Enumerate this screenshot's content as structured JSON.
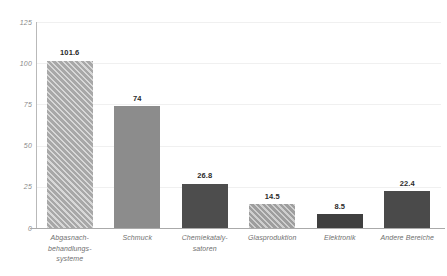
{
  "chart_data": {
    "type": "bar",
    "title": "",
    "subtitle": "",
    "xlabel": "",
    "ylabel": "",
    "ylim": [
      0,
      125
    ],
    "yticks": [
      "0",
      "25",
      "50",
      "75",
      "100",
      "125"
    ],
    "grid": true,
    "legend": false,
    "categories": [
      "Abgasnach-behandlungs-systeme",
      "Schmuck",
      "Chemiekataly-satoren",
      "Glasproduktion",
      "Elektronik",
      "Andere Bereiche"
    ],
    "category_lines": [
      [
        "Abgasnach-",
        "behandlungs-",
        "systeme"
      ],
      [
        "Schmuck"
      ],
      [
        "Chemiekataly-",
        "satoren"
      ],
      [
        "Glasproduktion"
      ],
      [
        "Elektronik"
      ],
      [
        "Andere Bereiche"
      ]
    ],
    "values": [
      101.6,
      74,
      26.8,
      14.5,
      8.5,
      22.4
    ],
    "value_labels": [
      "101.6",
      "74",
      "26.8",
      "14.5",
      "8.5",
      "22.4"
    ],
    "bar_styles": [
      "hatch-light",
      "solid-mid",
      "solid-dark",
      "hatch-mid",
      "solid-dark2",
      "solid-dark3"
    ],
    "colors": {
      "bar_hatch_light": "#a8a8a8",
      "bar_solid_mid": "#8c8c8c",
      "bar_solid_dark": "#4d4d4d",
      "bar_hatch_mid": "#9e9e9e",
      "bar_solid_dark2": "#3f3f3f",
      "bar_solid_dark3": "#4a4a4a",
      "gridline": "#f0f0f0",
      "axis": "#aaaaaa",
      "tick_label": "#8a8a8a",
      "category_label": "#6f6f6f",
      "value_label": "#2b2b2b",
      "background": "#ffffff"
    }
  }
}
